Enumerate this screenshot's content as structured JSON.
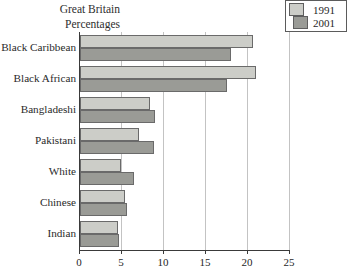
{
  "title": {
    "line1": "Great Britain",
    "line2": "Percentages"
  },
  "legend": {
    "position": "top-right",
    "entries": [
      {
        "label": "1991",
        "color": "#cccdc8"
      },
      {
        "label": "2001",
        "color": "#9a9b96"
      }
    ]
  },
  "chart_data": {
    "type": "bar",
    "orientation": "horizontal",
    "title": "Great Britain Percentages",
    "xlabel": "",
    "ylabel": "",
    "xlim": [
      0,
      25
    ],
    "xticks": [
      0,
      5,
      10,
      15,
      20,
      25
    ],
    "xtick_labels": [
      "0",
      "5",
      "10",
      "15",
      "20",
      "25"
    ],
    "grid": true,
    "grid_axis": "x",
    "legend_position": "top-right",
    "categories": [
      "Black Caribbean",
      "Black African",
      "Bangladeshi",
      "Pakistani",
      "White",
      "Chinese",
      "Indian"
    ],
    "series": [
      {
        "name": "1991",
        "color": "#cccdc8",
        "values": [
          20.6,
          21.0,
          8.3,
          7.0,
          4.9,
          5.3,
          4.5
        ]
      },
      {
        "name": "2001",
        "color": "#9a9b96",
        "values": [
          18.0,
          17.5,
          8.9,
          8.8,
          6.4,
          5.6,
          4.7
        ]
      }
    ]
  },
  "axis": {
    "tick_color": "#3a3a3a",
    "grid_color": "#c3c3c3"
  }
}
